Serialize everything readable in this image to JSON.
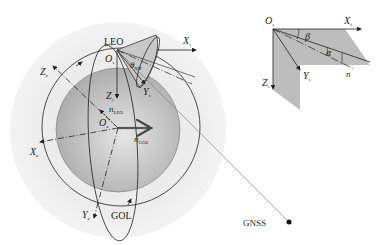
{
  "main_figure": {
    "labels": {
      "leo": "LEO",
      "gol": "GOL",
      "gnss": "GNSS",
      "xs_axis": "X",
      "xs_sub": "s",
      "zs_axis": "Z",
      "zs_sub": "s",
      "ys_axis": "Y",
      "ys_sub": "s",
      "os_origin": "O",
      "os_sub": "s",
      "theta": "θ",
      "theta_sub": "NM",
      "ze_axis": "Z",
      "ze_sub": "e",
      "xe_axis": "X",
      "xe_sub": "e",
      "ye_axis": "Y",
      "ye_sub": "e",
      "oe_origin": "O",
      "oe_sub": "e",
      "n_leo": "n",
      "n_leo_sub": "LEO",
      "n_gol": "n",
      "n_gol_sub": "GOL"
    }
  },
  "inset_figure": {
    "labels": {
      "os_origin": "O",
      "os_sub": "s",
      "xs_axis": "X",
      "xs_sub": "s",
      "ys_axis": "Y",
      "ys_sub": "s",
      "zs_axis": "Z",
      "zs_sub": "s",
      "beta": "β",
      "alpha": "α",
      "n": "n"
    }
  },
  "colors": {
    "halo": "#ececec",
    "earth_edge": "#a8a8a8",
    "earth_center": "#e4e4e4",
    "panel": "#b9b9b9",
    "line": "#222222"
  }
}
